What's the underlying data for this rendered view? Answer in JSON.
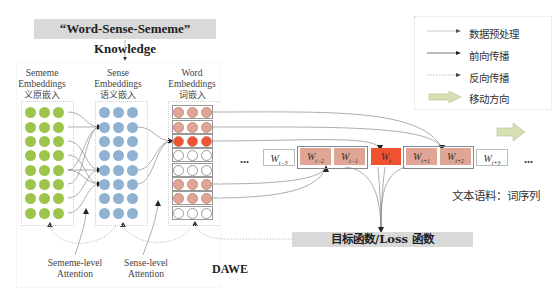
{
  "knowledge_box": {
    "label": "“Word-Sense-Sememe” Knowledge"
  },
  "columns": [
    {
      "title_line1": "Sememe",
      "title_line2": "Embeddings",
      "title_cn": "义原嵌入",
      "dot_color": "#9dc54c"
    },
    {
      "title_line1": "Sense",
      "title_line2": "Embeddings",
      "title_cn": "语义嵌入",
      "dot_color": "#8fb2d3"
    },
    {
      "title_line1": "Word",
      "title_line2": "Embeddings",
      "title_cn": "词嵌入",
      "dot_color": "#e0a594"
    }
  ],
  "word_rows": [
    "context",
    "context",
    "target",
    "empty",
    "empty",
    "context",
    "context",
    "empty"
  ],
  "colors": {
    "context": "#e0a594",
    "target": "#f0512f",
    "empty": "#ffffff",
    "sememe": "#9dc54c",
    "sense": "#8fb2d3",
    "gray_box": "#d9d9d9",
    "move_arrow": "#d6e0b4"
  },
  "legend": {
    "items": [
      {
        "icon": "thin-arrow",
        "label": "数据预处理"
      },
      {
        "icon": "solid-arrow",
        "label": "前向传播"
      },
      {
        "icon": "dotted-arrow",
        "label": "反向传播"
      },
      {
        "icon": "block-arrow",
        "label": "移动方向"
      }
    ]
  },
  "sequence": {
    "ellipsis_left": "...",
    "ellipsis_right": "...",
    "words": [
      {
        "base": "W",
        "sub": "t−3",
        "kind": "outside"
      },
      {
        "base": "W",
        "sub": "t−2",
        "kind": "context"
      },
      {
        "base": "W",
        "sub": "t−1",
        "kind": "context"
      },
      {
        "base": "W",
        "sub": "t",
        "kind": "target"
      },
      {
        "base": "W",
        "sub": "t+1",
        "kind": "context"
      },
      {
        "base": "W",
        "sub": "t+2",
        "kind": "context"
      },
      {
        "base": "W",
        "sub": "t+3",
        "kind": "outside"
      }
    ]
  },
  "corpus_label": "文本语料：词序列",
  "loss_box": {
    "label": "目标函数/Loss 函数"
  },
  "attention": {
    "sememe_line1": "Sememe-level",
    "sememe_line2": "Attention",
    "sense_line1": "Sense-level",
    "sense_line2": "Attention"
  },
  "model_label": "DAWE"
}
